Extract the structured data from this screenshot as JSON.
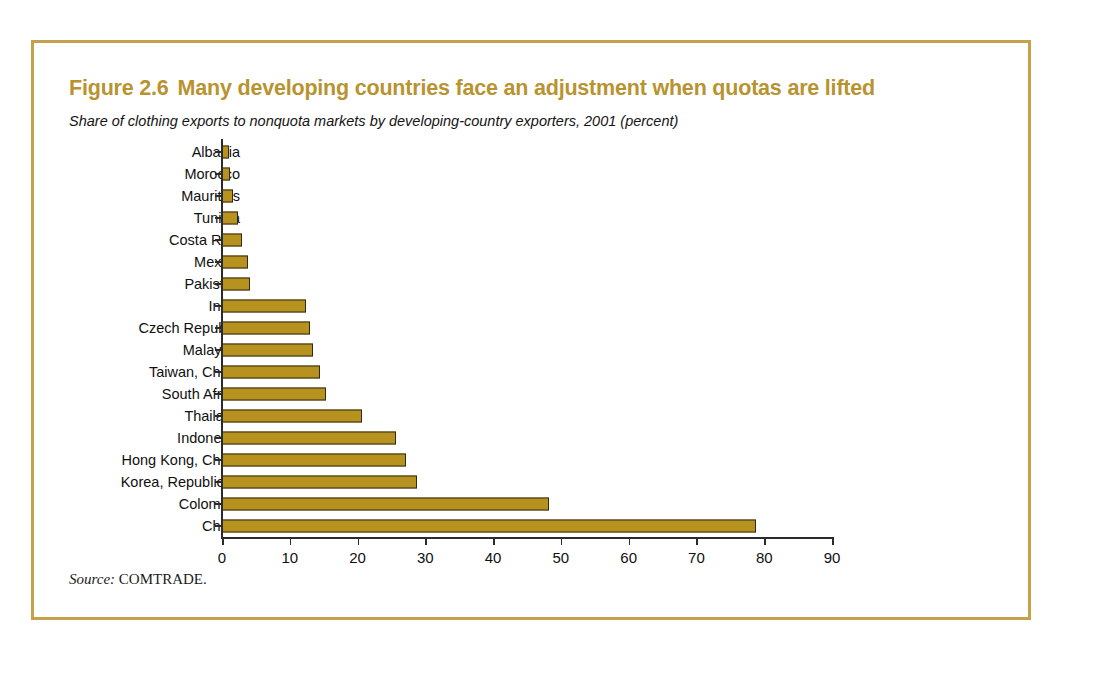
{
  "figure": {
    "number": "Figure 2.6",
    "title": "Many developing countries face an adjustment when quotas are lifted",
    "subtitle": "Share of clothing exports to nonquota markets by developing-country exporters, 2001 (percent)",
    "source_label": "Source:",
    "source_value": "COMTRADE.",
    "border_color": "#c5a24a",
    "title_color": "#b8932f",
    "bar_color": "#b8921f",
    "bar_outline_color": "#2e2a18"
  },
  "chart_data": {
    "type": "bar",
    "orientation": "horizontal",
    "title": "Many developing countries face an adjustment when quotas are lifted",
    "subtitle": "Share of clothing exports to nonquota markets by developing-country exporters, 2001 (percent)",
    "xlabel": "",
    "ylabel": "",
    "xlim": [
      0,
      90
    ],
    "xticks": [
      0,
      10,
      20,
      30,
      40,
      50,
      60,
      70,
      80,
      90
    ],
    "xtick_labels": [
      "0",
      "10",
      "20",
      "30",
      "40",
      "50",
      "60",
      "70",
      "80",
      "90"
    ],
    "grid": false,
    "legend": false,
    "units": "percent",
    "categories": [
      "Albania",
      "Morocco",
      "Mauritius",
      "Tunisia",
      "Costa Rica",
      "Mexico",
      "Pakistan",
      "India",
      "Czech Republic",
      "Malaysia",
      "Taiwan, China",
      "South Africa",
      "Thailand",
      "Indonesia",
      "Hong Kong, China",
      "Korea, Republic of",
      "Colombia",
      "China"
    ],
    "values": [
      1.0,
      1.2,
      1.6,
      2.3,
      3.0,
      3.9,
      4.2,
      12.4,
      13.0,
      13.4,
      14.5,
      15.3,
      20.7,
      25.6,
      27.1,
      28.8,
      48.3,
      78.8
    ]
  }
}
